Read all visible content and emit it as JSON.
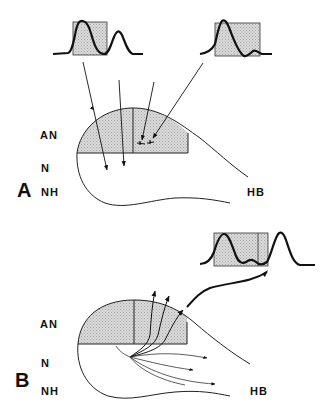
{
  "figure": {
    "panels": [
      {
        "id": "A",
        "label": "A",
        "region_labels": {
          "an": "AN",
          "n": "N",
          "nh": "NH",
          "hb": "HB"
        },
        "waveforms": 2,
        "description": "Two waveform plots with shaded windows; arrows point down into the AN region and into N"
      },
      {
        "id": "B",
        "label": "B",
        "region_labels": {
          "an": "AN",
          "n": "N",
          "nh": "NH",
          "hb": "HB"
        },
        "waveforms": 1,
        "description": "Arrows fan out from a point in N; a bold curved arrow leads to a waveform plot with a shaded window"
      }
    ],
    "colors": {
      "ink": "#111111",
      "shade": "#d4d4d4",
      "background": "#ffffff"
    }
  }
}
